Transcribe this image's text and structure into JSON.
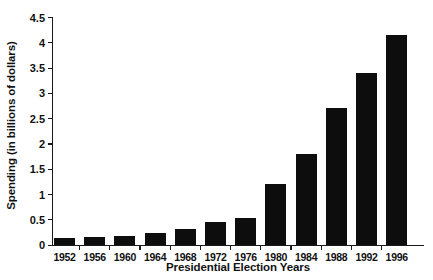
{
  "chart_data": {
    "type": "bar",
    "title": "",
    "xlabel": "Presidential Election Years",
    "ylabel": "Spending (in billions of dollars)",
    "categories": [
      "1952",
      "1956",
      "1960",
      "1964",
      "1968",
      "1972",
      "1976",
      "1980",
      "1984",
      "1988",
      "1992",
      "1996"
    ],
    "values": [
      0.14,
      0.16,
      0.18,
      0.22,
      0.3,
      0.44,
      0.52,
      1.2,
      1.8,
      2.7,
      3.4,
      4.15
    ],
    "series": [
      {
        "name": "Spending",
        "values": [
          0.14,
          0.16,
          0.18,
          0.22,
          0.3,
          0.44,
          0.52,
          1.2,
          1.8,
          2.7,
          3.4,
          4.15
        ]
      }
    ],
    "ylim": [
      0,
      4.5
    ],
    "yticks": [
      0,
      0.5,
      1,
      1.5,
      2,
      2.5,
      3,
      3.5,
      4,
      4.5
    ],
    "ytick_labels": [
      "0",
      "0.5",
      "1",
      "1.5",
      "2",
      "2.5",
      "3",
      "3.5",
      "4",
      "4.5"
    ],
    "grid": false,
    "legend": false,
    "legend_position": "none",
    "bar_color": "#0d0d0d",
    "axis_color": "#1a1a1a",
    "background": "#ffffff"
  }
}
